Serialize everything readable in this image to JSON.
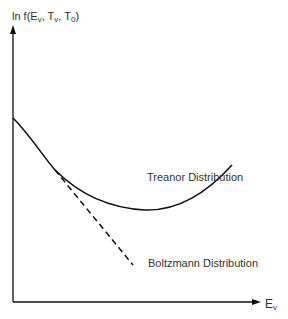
{
  "diagram": {
    "y_axis": {
      "label_main": "ln f(E",
      "sub1": "v",
      "sep1": ", T",
      "sub2": "v",
      "sep2": ", T",
      "sub3": "0",
      "end": ")"
    },
    "x_axis": {
      "label_main": "E",
      "sub": "v"
    },
    "curves": [
      {
        "name": "Treanor Distribution",
        "style": "solid"
      },
      {
        "name": "Boltzmann Distribution",
        "style": "dashed"
      }
    ],
    "colors": {
      "line": "#111111",
      "background": "#ffffff"
    }
  }
}
